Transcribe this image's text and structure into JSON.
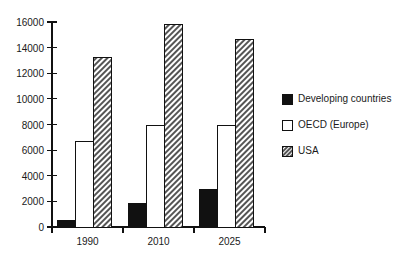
{
  "chart_data": {
    "type": "bar",
    "title": "",
    "subtitle": "",
    "xlabel": "",
    "ylabel": "",
    "categories": [
      "1990",
      "2010",
      "2025"
    ],
    "series": [
      {
        "name": "Developing countries",
        "values": [
          500,
          1850,
          2950
        ],
        "fill": "#111111",
        "pattern": "solid"
      },
      {
        "name": "OECD (Europe)",
        "values": [
          6700,
          7950,
          7950
        ],
        "fill": "#ffffff",
        "pattern": "outline"
      },
      {
        "name": "USA",
        "values": [
          13200,
          15800,
          14650
        ],
        "fill": "#cccccc",
        "pattern": "diagonal-hatch"
      }
    ],
    "ylim": [
      0,
      16000
    ],
    "yticks": [
      0,
      2000,
      4000,
      6000,
      8000,
      10000,
      12000,
      14000,
      16000
    ],
    "ytick_labels": [
      "0",
      "2000",
      "4000",
      "6000",
      "8000",
      "10000",
      "12000",
      "14000",
      "16000"
    ],
    "grid": false,
    "legend_position": "right",
    "legend_entries": [
      {
        "label": "Developing countries",
        "swatch": "solid-black"
      },
      {
        "label": "OECD (Europe)",
        "swatch": "outline-white"
      },
      {
        "label": "USA",
        "swatch": "diagonal-hatch"
      }
    ]
  },
  "colors": {
    "background": "#ffffff",
    "axis": "#111111",
    "text": "#1a1a1a",
    "series_developing": "#111111",
    "series_oecd": "#ffffff",
    "series_usa": "#cccccc"
  }
}
